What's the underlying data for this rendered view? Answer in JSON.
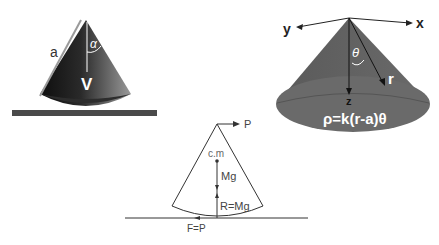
{
  "figure_left": {
    "label_side": "a",
    "label_angle": "α",
    "label_vertex": "V",
    "colors": {
      "cone_dark": "#1e1e1e",
      "cone_light": "#8a8a8a",
      "ground": "#4a4a4a"
    }
  },
  "figure_right": {
    "axis_x": "x",
    "axis_y": "y",
    "axis_z": "z",
    "label_angle": "θ",
    "label_radius": "r",
    "density_formula": "ρ=k(r-a)θ",
    "colors": {
      "cone": "#616161",
      "base": "#6e6e6e",
      "text": "#ffffff"
    }
  },
  "figure_bottom": {
    "force_top": "P",
    "center_of_mass": "c.m",
    "weight": "Mg",
    "reaction": "R=Mg",
    "friction": "F=P",
    "colors": {
      "line": "#333333",
      "text": "#444444"
    }
  }
}
